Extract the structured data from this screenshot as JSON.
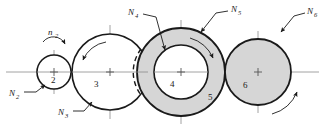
{
  "figure": {
    "type": "gear-train-diagram",
    "background_color": "#ffffff",
    "stroke_color": "#1a1a1a",
    "fill_shaded": "#d6d6d6",
    "fill_plain": "#ffffff",
    "centerline_color": "#8a8a8a"
  },
  "gears": [
    {
      "id": "gear-2",
      "number": "2",
      "cx": 54,
      "cy": 72,
      "r": 17,
      "shaded": false
    },
    {
      "id": "gear-3",
      "number": "3",
      "cx": 110,
      "cy": 72,
      "r": 38,
      "shaded": false
    },
    {
      "id": "gear-4",
      "number": "4",
      "cx": 181,
      "cy": 72,
      "r": 27,
      "shaded": false
    },
    {
      "id": "gear-5",
      "number": "5",
      "cx": 181,
      "cy": 72,
      "r": 44,
      "shaded": true
    },
    {
      "id": "gear-6",
      "number": "6",
      "cx": 258,
      "cy": 72,
      "r": 33,
      "shaded": true
    }
  ],
  "labels": {
    "n2_speed": {
      "base": "n",
      "sub": "2"
    },
    "N2": {
      "base": "N",
      "sub": "2"
    },
    "N3": {
      "base": "N",
      "sub": "3"
    },
    "N4": {
      "base": "N",
      "sub": "4"
    },
    "N5": {
      "base": "N",
      "sub": "5"
    },
    "N6": {
      "base": "N",
      "sub": "6"
    }
  },
  "numbers": {
    "two": "2",
    "three": "3",
    "four": "4",
    "five": "5",
    "six": "6"
  },
  "rotation_arrows": [
    {
      "id": "arrow-n2",
      "gear": "2",
      "direction": "clockwise",
      "location": "above-gear-2"
    },
    {
      "id": "arrow-gear-3",
      "gear": "3",
      "direction": "counterclockwise",
      "location": "inside-upper-left"
    },
    {
      "id": "arrow-gear-5",
      "gear": "5",
      "direction": "clockwise",
      "location": "inside-annulus-upper-right"
    },
    {
      "id": "arrow-gear-6",
      "gear": "6",
      "direction": "counterclockwise",
      "location": "outside-lower-right"
    }
  ]
}
